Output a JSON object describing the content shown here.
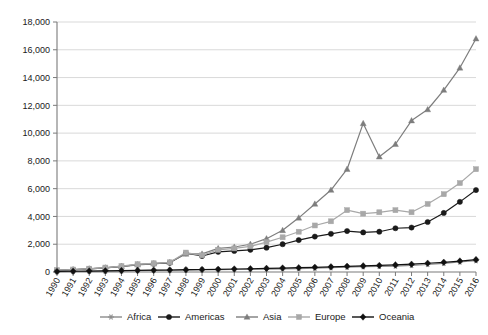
{
  "chart_data": {
    "type": "line",
    "title": "",
    "subtitle": "",
    "xlabel": "",
    "ylabel": "",
    "ylim": [
      0,
      18000
    ],
    "ytick_step": 2000,
    "ytick_labels": [
      "0",
      "2,000",
      "4,000",
      "6,000",
      "8,000",
      "10,000",
      "12,000",
      "14,000",
      "16,000",
      "18,000"
    ],
    "ytick_values": [
      0,
      2000,
      4000,
      6000,
      8000,
      10000,
      12000,
      14000,
      16000,
      18000
    ],
    "grid": true,
    "legend_position": "bottom",
    "x": [
      "1990",
      "1991",
      "1992",
      "1993",
      "1994",
      "1995",
      "1996",
      "1997",
      "1998",
      "1999",
      "2000",
      "2001",
      "2002",
      "2003",
      "2004",
      "2005",
      "2006",
      "2007",
      "2008",
      "2009",
      "2010",
      "2011",
      "2012",
      "2013",
      "2014",
      "2015",
      "2016"
    ],
    "categories": [
      "1990",
      "1991",
      "1992",
      "1993",
      "1994",
      "1995",
      "1996",
      "1997",
      "1998",
      "1999",
      "2000",
      "2001",
      "2002",
      "2003",
      "2004",
      "2005",
      "2006",
      "2007",
      "2008",
      "2009",
      "2010",
      "2011",
      "2012",
      "2013",
      "2014",
      "2015",
      "2016"
    ],
    "series": [
      {
        "name": "Africa",
        "marker": "star",
        "color": "#8c8c8c",
        "values": [
          30,
          40,
          55,
          65,
          80,
          95,
          110,
          120,
          140,
          150,
          165,
          180,
          195,
          210,
          230,
          250,
          280,
          310,
          350,
          380,
          400,
          430,
          470,
          540,
          620,
          720,
          820
        ]
      },
      {
        "name": "Americas",
        "marker": "circle",
        "color": "#1a1a1a",
        "values": [
          120,
          170,
          230,
          300,
          400,
          530,
          600,
          660,
          1350,
          1150,
          1450,
          1520,
          1600,
          1750,
          2000,
          2300,
          2550,
          2750,
          2950,
          2850,
          2900,
          3150,
          3200,
          3600,
          4250,
          5050,
          5900
        ]
      },
      {
        "name": "Asia",
        "marker": "triangle",
        "color": "#7d7d7d",
        "values": [
          110,
          160,
          220,
          290,
          390,
          520,
          590,
          700,
          1300,
          1300,
          1700,
          1800,
          2000,
          2400,
          3000,
          3900,
          4900,
          5900,
          7400,
          10700,
          8300,
          9200,
          10900,
          11700,
          13100,
          14700,
          16800
        ]
      },
      {
        "name": "Europe",
        "marker": "square",
        "color": "#a8a8a8",
        "values": [
          130,
          180,
          240,
          320,
          420,
          560,
          630,
          700,
          1400,
          1200,
          1600,
          1700,
          1850,
          2150,
          2500,
          2900,
          3350,
          3650,
          4450,
          4200,
          4300,
          4450,
          4300,
          4900,
          5600,
          6400,
          7400
        ]
      },
      {
        "name": "Oceania",
        "marker": "diamond",
        "color": "#111111",
        "values": [
          40,
          55,
          70,
          85,
          100,
          115,
          130,
          145,
          165,
          180,
          195,
          215,
          235,
          260,
          285,
          310,
          340,
          370,
          410,
          440,
          470,
          510,
          560,
          630,
          700,
          790,
          890
        ]
      }
    ]
  },
  "legend": {
    "items": [
      {
        "label": "Africa"
      },
      {
        "label": "Americas"
      },
      {
        "label": "Asia"
      },
      {
        "label": "Europe"
      },
      {
        "label": "Oceania"
      }
    ]
  }
}
